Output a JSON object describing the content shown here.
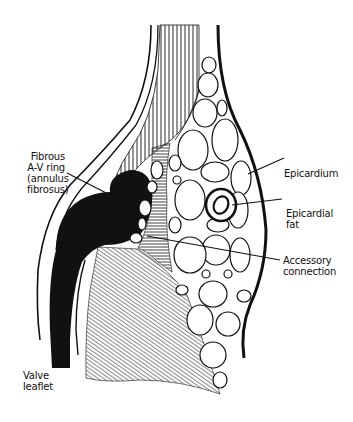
{
  "diagram": {
    "type": "anatomical cross-section",
    "labels": {
      "annulus": [
        "Fibrous",
        "A-V ring",
        "(annulus",
        "fibrosus)"
      ],
      "epicardium": [
        "Epicardium"
      ],
      "fat": [
        "Epicardial",
        "fat"
      ],
      "accessory": [
        "Accessory",
        "connection"
      ],
      "valve": [
        "Valve",
        "leaflet"
      ]
    },
    "colors": {
      "ink": "#111111",
      "background": "#ffffff"
    }
  }
}
